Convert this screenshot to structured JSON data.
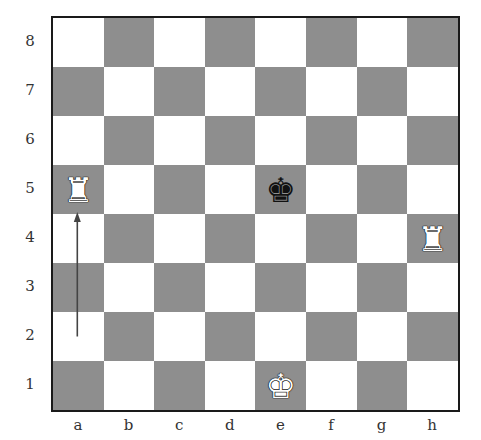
{
  "board": {
    "files": [
      "a",
      "b",
      "c",
      "d",
      "e",
      "f",
      "g",
      "h"
    ],
    "ranks": [
      "8",
      "7",
      "6",
      "5",
      "4",
      "3",
      "2",
      "1"
    ],
    "colors": {
      "light": "#ffffff",
      "dark": "#8e8e8e",
      "border": "#1a1a1a"
    },
    "pieces": [
      {
        "square": "a5",
        "type": "rook",
        "color": "white",
        "glyph": "♜"
      },
      {
        "square": "h4",
        "type": "rook",
        "color": "white",
        "glyph": "♜"
      },
      {
        "square": "e5",
        "type": "king",
        "color": "black",
        "glyph": "♚"
      },
      {
        "square": "e1",
        "type": "king",
        "color": "white",
        "glyph": "♚"
      }
    ],
    "arrows": [
      {
        "from": "a2",
        "to": "a5",
        "color": "#444444"
      }
    ]
  }
}
